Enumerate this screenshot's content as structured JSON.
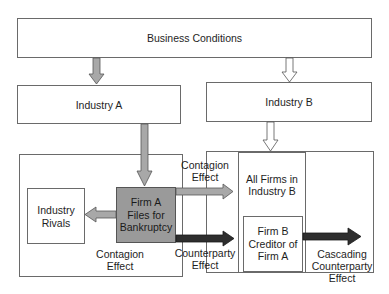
{
  "diagram": {
    "nodes": {
      "business_conditions": "Business Conditions",
      "industry_a": "Industry A",
      "industry_b": "Industry B",
      "industry_rivals": [
        "Industry",
        "Rivals"
      ],
      "firm_a": [
        "Firm A",
        "Files for",
        "Bankruptcy"
      ],
      "all_firms_b": [
        "All Firms in",
        "Industry B"
      ],
      "firm_b": [
        "Firm B",
        "Creditor of",
        "Firm A"
      ]
    },
    "edge_labels": {
      "contagion_rivals": [
        "Contagion",
        "Effect"
      ],
      "contagion_b": [
        "Contagion",
        "Effect"
      ],
      "counterparty": [
        "Counterparty",
        "Effect"
      ],
      "cascading": [
        "Cascading",
        "Counterparty",
        "Effect"
      ]
    },
    "colors": {
      "border": "#6a6a6a",
      "firm_a_fill": "#9a9a9a",
      "contagion_arrow": "#a8a8a8",
      "counterparty_arrow": "#2e2e2e",
      "hollow_arrow": "#ffffff"
    }
  }
}
